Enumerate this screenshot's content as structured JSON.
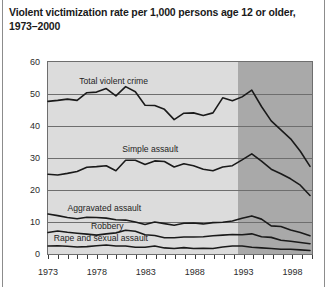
{
  "title": "Violent victimization rate per 1,000 persons age 12 or older,\n1973–2000",
  "colors": {
    "plot_light": "#dcdcdc",
    "plot_dark": "#a9a9a9",
    "line": "#1a1a1a",
    "grid": "#6e6e6e",
    "text": "#1a1a1a"
  },
  "axes": {
    "y_ticks": [
      "0",
      "10",
      "20",
      "30",
      "40",
      "50",
      "60"
    ],
    "x_ticks": [
      "1973",
      "1978",
      "1983",
      "1988",
      "1993",
      "1998"
    ],
    "x_tick_years": [
      1973,
      1978,
      1983,
      1988,
      1993,
      1998
    ]
  },
  "annotations": [
    {
      "name": "total-violent-crime",
      "label": "Total violent crime"
    },
    {
      "name": "simple-assault",
      "label": "Simple assault"
    },
    {
      "name": "aggravated-assault",
      "label": "Aggravated assault"
    },
    {
      "name": "robbery",
      "label": "Robbery"
    },
    {
      "name": "rape-and-sexual-assault",
      "label": "Rape and sexual assault"
    }
  ],
  "shaded_region": {
    "label": "redesigned survey period shading",
    "start_year": 1992.4,
    "end_year": 2000
  },
  "chart_data": {
    "type": "line",
    "title": "Violent victimization rate per 1,000 persons age 12 or older, 1973–2000",
    "xlabel": "",
    "ylabel": "",
    "xlim": [
      1973,
      2000
    ],
    "ylim": [
      0,
      60
    ],
    "grid": true,
    "legend": "inline annotations on each line",
    "x": [
      1973,
      1974,
      1975,
      1976,
      1977,
      1978,
      1979,
      1980,
      1981,
      1982,
      1983,
      1984,
      1985,
      1986,
      1987,
      1988,
      1989,
      1990,
      1991,
      1992,
      1993,
      1994,
      1995,
      1996,
      1997,
      1998,
      1999,
      2000
    ],
    "series": [
      {
        "name": "Total violent crime",
        "values": [
          47.7,
          48.0,
          48.4,
          48.0,
          50.4,
          50.6,
          51.7,
          49.4,
          52.3,
          50.7,
          46.5,
          46.4,
          45.2,
          42.0,
          44.0,
          44.1,
          43.3,
          44.1,
          48.8,
          47.9,
          49.1,
          51.2,
          46.1,
          41.6,
          38.8,
          36.0,
          32.1,
          27.4
        ]
      },
      {
        "name": "Simple assault",
        "values": [
          24.9,
          24.7,
          25.2,
          25.8,
          27.1,
          27.3,
          27.6,
          26.0,
          29.3,
          29.3,
          28.0,
          29.1,
          28.9,
          27.2,
          28.2,
          27.6,
          26.5,
          26.0,
          27.2,
          27.6,
          29.4,
          31.3,
          29.0,
          26.5,
          25.1,
          23.5,
          21.5,
          18.3
        ]
      },
      {
        "name": "Aggravated assault",
        "values": [
          12.5,
          12.0,
          11.4,
          11.0,
          11.5,
          11.4,
          11.2,
          10.7,
          10.6,
          10.0,
          9.2,
          10.0,
          9.5,
          9.0,
          9.6,
          9.7,
          9.4,
          9.8,
          9.9,
          10.3,
          11.2,
          11.9,
          10.9,
          8.8,
          8.6,
          7.5,
          6.7,
          5.7
        ]
      },
      {
        "name": "Robbery",
        "values": [
          6.7,
          7.2,
          6.8,
          6.5,
          6.2,
          5.9,
          6.3,
          6.6,
          7.4,
          7.1,
          6.0,
          5.8,
          5.1,
          5.1,
          5.3,
          5.3,
          5.4,
          5.7,
          5.9,
          6.1,
          6.0,
          6.3,
          5.4,
          5.2,
          4.3,
          4.0,
          3.6,
          3.2
        ]
      },
      {
        "name": "Rape and sexual assault",
        "values": [
          2.5,
          2.6,
          2.4,
          2.2,
          2.3,
          2.6,
          2.8,
          2.5,
          2.5,
          2.1,
          2.1,
          2.5,
          1.9,
          1.7,
          2.0,
          1.7,
          1.8,
          1.7,
          2.2,
          2.5,
          2.5,
          2.1,
          1.9,
          1.7,
          1.5,
          1.5,
          1.3,
          1.1
        ]
      }
    ]
  }
}
